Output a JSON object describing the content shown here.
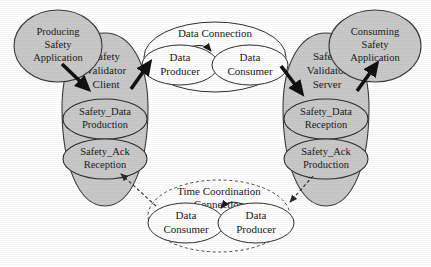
{
  "diagram": {
    "canvas": {
      "width": 431,
      "height": 267,
      "background": "#ffffff"
    },
    "colors": {
      "shaded_fill": "#c9c9c9",
      "white_fill": "#ffffff",
      "stroke": "#2e2e2e",
      "thick_arrow": "#111111"
    },
    "applications": [
      {
        "id": "producing-safety-application",
        "lines": [
          "Producing",
          "Safety",
          "Application"
        ],
        "side": "left"
      },
      {
        "id": "consuming-safety-application",
        "lines": [
          "Consuming",
          "Safety",
          "Application"
        ],
        "side": "right"
      }
    ],
    "validators": [
      {
        "id": "safety-validator-client",
        "lines": [
          "Safety",
          "Validator",
          "Client"
        ],
        "operations": [
          {
            "id": "safety-data-production",
            "lines": [
              "Safety_Data",
              "Production"
            ]
          },
          {
            "id": "safety-ack-reception",
            "lines": [
              "Safety_Ack",
              "Reception"
            ]
          }
        ]
      },
      {
        "id": "safety-validator-server",
        "lines": [
          "Safety",
          "Validator",
          "Server"
        ],
        "operations": [
          {
            "id": "safety-data-reception",
            "lines": [
              "Safety_Data",
              "Reception"
            ]
          },
          {
            "id": "safety-ack-production",
            "lines": [
              "Safety_Ack",
              "Production"
            ]
          }
        ]
      }
    ],
    "connections": [
      {
        "id": "data-connection",
        "lines": [
          "Data Connection"
        ],
        "style": "solid",
        "roles": [
          {
            "id": "data-connection-data-producer",
            "lines": [
              "Data",
              "Producer"
            ],
            "position": "left"
          },
          {
            "id": "data-connection-data-consumer",
            "lines": [
              "Data",
              "Consumer"
            ],
            "position": "right"
          }
        ]
      },
      {
        "id": "time-coordination-connection",
        "lines": [
          "Time Coordination",
          "Connection"
        ],
        "style": "dashed",
        "roles": [
          {
            "id": "time-coordination-data-consumer",
            "lines": [
              "Data",
              "Consumer"
            ],
            "position": "left"
          },
          {
            "id": "time-coordination-data-producer",
            "lines": [
              "Data",
              "Producer"
            ],
            "position": "right"
          }
        ]
      }
    ],
    "arrows": [
      {
        "id": "arrow-producing-app-to-client",
        "style": "thick",
        "from": "producing-safety-application",
        "to": "safety-validator-client"
      },
      {
        "id": "arrow-client-to-data-producer",
        "style": "thick",
        "from": "safety-validator-client",
        "to": "data-connection-data-producer"
      },
      {
        "id": "arrow-data-producer-to-data-consumer",
        "style": "thin",
        "from": "data-connection-data-producer",
        "to": "data-connection-data-consumer"
      },
      {
        "id": "arrow-data-consumer-to-server",
        "style": "thick",
        "from": "data-connection-data-consumer",
        "to": "safety-validator-server"
      },
      {
        "id": "arrow-server-to-consuming-app",
        "style": "thick",
        "from": "safety-validator-server",
        "to": "consuming-safety-application"
      },
      {
        "id": "arrow-ack-production-to-time-data-producer",
        "style": "dashed",
        "from": "safety-ack-production",
        "to": "time-coordination-data-producer"
      },
      {
        "id": "arrow-time-data-producer-to-time-data-consumer",
        "style": "thin",
        "from": "time-coordination-data-producer",
        "to": "time-coordination-data-consumer"
      },
      {
        "id": "arrow-time-data-consumer-to-ack-reception",
        "style": "dashed",
        "from": "time-coordination-data-consumer",
        "to": "safety-ack-reception"
      }
    ]
  }
}
